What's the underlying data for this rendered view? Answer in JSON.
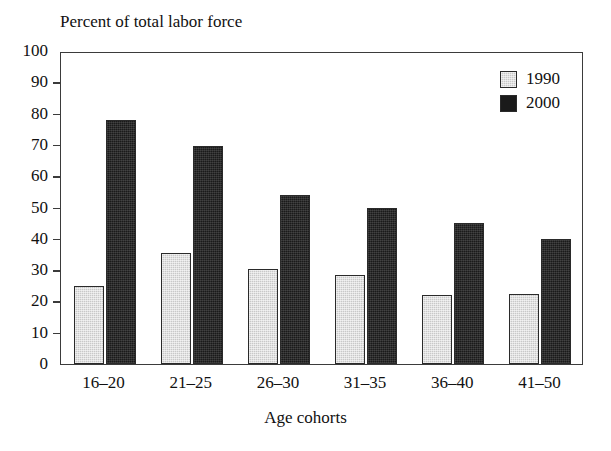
{
  "chart_data": {
    "type": "bar",
    "title": "Percent of total labor force",
    "xlabel": "Age cohorts",
    "ylabel": "",
    "ylim": [
      0,
      100
    ],
    "y_ticks": [
      0,
      10,
      20,
      30,
      40,
      50,
      60,
      70,
      80,
      90,
      100
    ],
    "grid": false,
    "legend_position": "top-right-inside",
    "categories": [
      "16–20",
      "21–25",
      "26–30",
      "31–35",
      "36–40",
      "41–50"
    ],
    "series": [
      {
        "name": "1990",
        "color": "#c8c8c8",
        "values": [
          25,
          35.5,
          30.5,
          28.5,
          22,
          22.5
        ]
      },
      {
        "name": "2000",
        "color": "#1a1a1a",
        "values": [
          78,
          69.5,
          54,
          50,
          45,
          40
        ]
      }
    ]
  },
  "axis": {
    "frame_color": "#3b3b3b"
  }
}
